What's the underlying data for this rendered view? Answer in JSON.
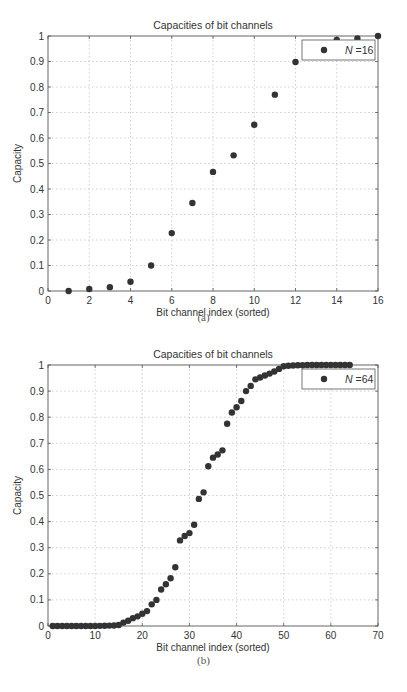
{
  "chart_data": [
    {
      "type": "scatter",
      "title": "Capacities of bit channels",
      "xlabel": "Bit channel index (sorted)",
      "ylabel": "Capacity",
      "xlim": [
        0,
        16
      ],
      "ylim": [
        0,
        1
      ],
      "xticks": [
        0,
        2,
        4,
        6,
        8,
        10,
        12,
        14,
        16
      ],
      "yticks": [
        0,
        0.1,
        0.2,
        0.3,
        0.4,
        0.5,
        0.6,
        0.7,
        0.8,
        0.9,
        1
      ],
      "ytick_labels": [
        "0",
        "0.1",
        "0.2",
        "0.3",
        "0.4",
        "0.5",
        "0.6",
        "0.7",
        "0.8",
        "0.9",
        "1"
      ],
      "grid": true,
      "legend": {
        "position": "upper right",
        "entries": [
          "N = 16"
        ],
        "label_italic": "N",
        "label_rest": "=16"
      },
      "caption": "(a)",
      "series": [
        {
          "name": "N = 16",
          "x": [
            1,
            2,
            3,
            4,
            5,
            6,
            7,
            8,
            9,
            10,
            11,
            12,
            13,
            14,
            15,
            16
          ],
          "values": [
            0.0,
            0.008,
            0.015,
            0.036,
            0.1,
            0.227,
            0.345,
            0.467,
            0.532,
            0.652,
            0.77,
            0.898,
            0.964,
            0.985,
            0.99,
            1.0
          ]
        }
      ]
    },
    {
      "type": "scatter",
      "title": "Capacities of bit channels",
      "xlabel": "Bit channel index (sorted)",
      "ylabel": "Capacity",
      "xlim": [
        0,
        70
      ],
      "ylim": [
        0,
        1
      ],
      "xticks": [
        0,
        10,
        20,
        30,
        40,
        50,
        60,
        70
      ],
      "yticks": [
        0,
        0.1,
        0.2,
        0.3,
        0.4,
        0.5,
        0.6,
        0.7,
        0.8,
        0.9,
        1
      ],
      "ytick_labels": [
        "0",
        "0.1",
        "0.2",
        "0.3",
        "0.4",
        "0.5",
        "0.6",
        "0.7",
        "0.8",
        "0.9",
        "1"
      ],
      "grid": true,
      "legend": {
        "position": "upper right",
        "entries": [
          "N = 64"
        ],
        "label_italic": "N",
        "label_rest": "=64"
      },
      "caption": "(b)",
      "series": [
        {
          "name": "N = 64",
          "x": [
            1,
            2,
            3,
            4,
            5,
            6,
            7,
            8,
            9,
            10,
            11,
            12,
            13,
            14,
            15,
            16,
            17,
            18,
            19,
            20,
            21,
            22,
            23,
            24,
            25,
            26,
            27,
            28,
            29,
            30,
            31,
            32,
            33,
            34,
            35,
            36,
            37,
            38,
            39,
            40,
            41,
            42,
            43,
            44,
            45,
            46,
            47,
            48,
            49,
            50,
            51,
            52,
            53,
            54,
            55,
            56,
            57,
            58,
            59,
            60,
            61,
            62,
            63,
            64
          ],
          "values": [
            0,
            0,
            0,
            0,
            0,
            0,
            0,
            0,
            0,
            0,
            0.0005,
            0.001,
            0.0015,
            0.002,
            0.004,
            0.013,
            0.02,
            0.03,
            0.037,
            0.047,
            0.057,
            0.083,
            0.1,
            0.14,
            0.16,
            0.183,
            0.225,
            0.328,
            0.345,
            0.356,
            0.388,
            0.487,
            0.512,
            0.612,
            0.645,
            0.657,
            0.673,
            0.775,
            0.818,
            0.838,
            0.862,
            0.9,
            0.92,
            0.945,
            0.952,
            0.96,
            0.967,
            0.975,
            0.985,
            0.995,
            0.997,
            0.998,
            0.999,
            0.999,
            1,
            1,
            1,
            1,
            1,
            1,
            1,
            1,
            1,
            1
          ]
        }
      ]
    }
  ],
  "colors": {
    "marker": "#333333",
    "axis": "#555555",
    "grid": "#bbbbbb",
    "text": "#333333"
  }
}
